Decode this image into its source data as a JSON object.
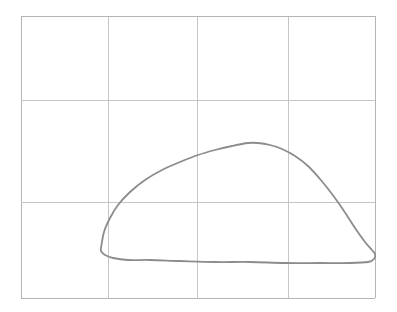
{
  "figure": {
    "title": "",
    "background_color": "#ffffff",
    "width": 397,
    "height": 312
  },
  "grid": {
    "line_color": "#c6c6c6",
    "line_width": 1,
    "border_color": "#b4b4b4",
    "columns": 4,
    "rows": 3,
    "x_positions": [
      21,
      108,
      197,
      288,
      375
    ],
    "y_positions": [
      16,
      100,
      202,
      298
    ],
    "tick_labels_x": [],
    "tick_labels_y": []
  },
  "chart_data": {
    "type": "line",
    "title": "",
    "xlabel": "",
    "ylabel": "",
    "grid": true,
    "legend": null,
    "xlim": [
      21,
      375
    ],
    "ylim": [
      298,
      16
    ],
    "series": [
      {
        "name": "closed-loop-curve",
        "color": "#8c8c8c",
        "line_width": 1.8,
        "closed": true,
        "points": [
          [
            101,
            248
          ],
          [
            104,
            232
          ],
          [
            110,
            218
          ],
          [
            118,
            205
          ],
          [
            130,
            192
          ],
          [
            145,
            180
          ],
          [
            162,
            170
          ],
          [
            180,
            162
          ],
          [
            198,
            155
          ],
          [
            215,
            150
          ],
          [
            232,
            146
          ],
          [
            248,
            143
          ],
          [
            258,
            143
          ],
          [
            270,
            145
          ],
          [
            282,
            149
          ],
          [
            295,
            156
          ],
          [
            308,
            166
          ],
          [
            320,
            179
          ],
          [
            332,
            194
          ],
          [
            344,
            211
          ],
          [
            355,
            228
          ],
          [
            365,
            242
          ],
          [
            372,
            250
          ],
          [
            375,
            254
          ],
          [
            374,
            259
          ],
          [
            368,
            262
          ],
          [
            350,
            263
          ],
          [
            320,
            263
          ],
          [
            285,
            263
          ],
          [
            250,
            262
          ],
          [
            215,
            262
          ],
          [
            180,
            261
          ],
          [
            150,
            260
          ],
          [
            128,
            260
          ],
          [
            113,
            258
          ],
          [
            105,
            255
          ],
          [
            101,
            251
          ],
          [
            101,
            248
          ]
        ]
      }
    ]
  },
  "annotations": []
}
